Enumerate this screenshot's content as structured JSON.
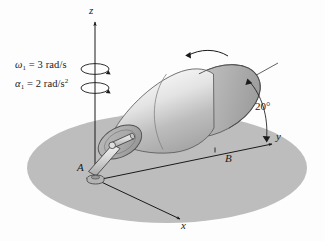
{
  "figure": {
    "axes": {
      "z_label": "z",
      "y_label": "y",
      "x_label": "x"
    },
    "points": {
      "a_label": "A",
      "b_label": "B"
    },
    "annotations": {
      "angle_label": "20°",
      "omega_symbol": "ω",
      "omega_subscript": "1",
      "omega_equals": " = 3 rad/s",
      "alpha_symbol": "α",
      "alpha_subscript": "1",
      "alpha_equals": " = 2 rad/s",
      "alpha_exponent": "2",
      "omega_full": "ω₁ = 3 rad/s",
      "alpha_full": "α₁ = 2 rad/s²"
    },
    "icons": {
      "z_axis_arrow": "up-arrow-icon",
      "omega_spin_arrow": "circular-rotation-arrow-icon",
      "alpha_spin_arrow": "circular-rotation-arrow-icon",
      "cone_spin_arrow": "curved-rotation-arrow-icon",
      "angle_arc_arrow": "arc-arrow-icon",
      "ground_plane": "ellipse-ground-icon",
      "cone_body": "truncated-cone-icon",
      "bent_rod": "bent-shaft-icon",
      "bearing": "bearing-collar-icon"
    },
    "colors": {
      "ground_fill": "#bdbdbd",
      "cone_light": "#f2f2f2",
      "cone_mid": "#c9c9c9",
      "cone_dark": "#9a9a9a",
      "cone_end_face": "#b8b8b8",
      "line_stroke": "#1a1a1a",
      "rod_fill": "#d8d8d8",
      "background": "#fdfdfd"
    },
    "geometry": {
      "cone_axis_angle_deg": 20,
      "apex_x": 96,
      "apex_y": 175
    }
  }
}
